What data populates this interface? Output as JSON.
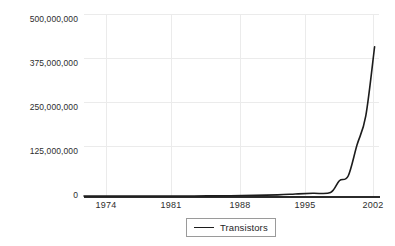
{
  "chart_data": {
    "type": "line",
    "title": "",
    "xlabel": "",
    "ylabel": "",
    "xlim": [
      1971,
      2004.5
    ],
    "ylim": [
      0,
      500000000
    ],
    "grid": true,
    "legend_position": "bottom-center",
    "x_ticks": [
      "1974",
      "1981",
      "1988",
      "1995",
      "2002"
    ],
    "x_tick_values": [
      1974,
      1981,
      1988,
      1995,
      2002
    ],
    "y_ticks": [
      "0",
      "125,000,000",
      "250,000,000",
      "375,000,000",
      "500,000,000"
    ],
    "y_tick_values": [
      0,
      125000000,
      250000000,
      375000000,
      500000000
    ],
    "series": [
      {
        "name": "Transistors",
        "color": "#1c1c1c",
        "x": [
          1971,
          1974,
          1978,
          1982,
          1985,
          1989,
          1993,
          1995,
          1997,
          1999,
          2000,
          2001,
          2002,
          2003,
          2004
        ],
        "values": [
          2300,
          6000,
          29000,
          134000,
          275000,
          1180000,
          3100000,
          5500000,
          7500000,
          9500000,
          42000000,
          55000000,
          140000000,
          220000000,
          410000000
        ]
      }
    ]
  },
  "legend": {
    "items": [
      {
        "label": "Transistors",
        "color": "#1c1c1c"
      }
    ]
  },
  "axes": {
    "y_labels": [
      "500,000,000",
      "375,000,000",
      "250,000,000",
      "125,000,000",
      "0"
    ],
    "x_labels": [
      "1974",
      "1981",
      "1988",
      "1995",
      "2002"
    ]
  }
}
